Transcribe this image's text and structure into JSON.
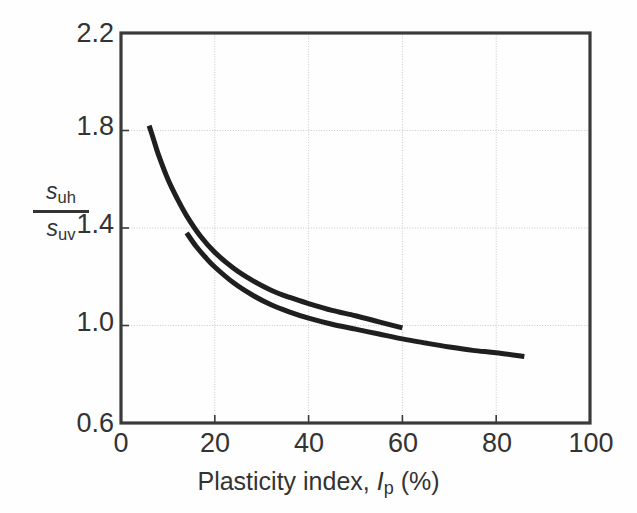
{
  "chart_data": {
    "type": "line",
    "title": "",
    "xlabel": "Plasticity index, Ip (%)",
    "xlabel_parts": {
      "pre": "Plasticity index, ",
      "symbol": "I",
      "sub": "p",
      "post": " (%)"
    },
    "ylabel": "suh / suv",
    "ylabel_parts": {
      "numerator_symbol": "s",
      "numerator_sub": "uh",
      "denominator_symbol": "s",
      "denominator_sub": "uv"
    },
    "xlim": [
      0,
      100
    ],
    "ylim": [
      0.6,
      2.2
    ],
    "xticks": [
      "0",
      "20",
      "40",
      "60",
      "80",
      "100"
    ],
    "xtick_values": [
      0,
      20,
      40,
      60,
      80,
      100
    ],
    "yticks": [
      "2.2",
      "1.8",
      "1.4",
      "1.0",
      "0.6"
    ],
    "ytick_values": [
      2.2,
      1.8,
      1.4,
      1.0,
      0.6
    ],
    "grid": true,
    "grid_x_values": [
      20,
      40,
      60,
      80
    ],
    "grid_y_values": [
      1.8,
      1.4,
      1.0
    ],
    "legend": "none",
    "line_color": "#1f1f1f",
    "grid_color": "#c8c8c8",
    "frame_color": "#3a3a3a",
    "series": [
      {
        "name": "upper-curve",
        "x": [
          6,
          7,
          8,
          10,
          12,
          14,
          17,
          20,
          24,
          28,
          32,
          36,
          40,
          45,
          50,
          55,
          60
        ],
        "y": [
          1.82,
          1.76,
          1.7,
          1.6,
          1.52,
          1.45,
          1.365,
          1.3,
          1.235,
          1.185,
          1.145,
          1.115,
          1.09,
          1.062,
          1.04,
          1.015,
          0.99
        ]
      },
      {
        "name": "lower-curve",
        "x": [
          14,
          16,
          18,
          20,
          24,
          28,
          32,
          36,
          40,
          45,
          50,
          55,
          60,
          65,
          70,
          75,
          80,
          86
        ],
        "y": [
          1.38,
          1.325,
          1.28,
          1.24,
          1.175,
          1.125,
          1.085,
          1.055,
          1.03,
          1.005,
          0.985,
          0.965,
          0.945,
          0.928,
          0.912,
          0.898,
          0.888,
          0.873
        ]
      }
    ]
  }
}
